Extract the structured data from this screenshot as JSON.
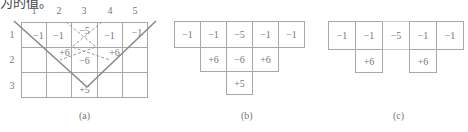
{
  "header_fragment": "为的值。",
  "panel_a": {
    "caption": "(a)",
    "col_labels": [
      "1",
      "2",
      "3",
      "4",
      "5"
    ],
    "row_labels": [
      "1",
      "2",
      "3"
    ],
    "cells": {
      "r1": [
        "−1",
        "−1",
        "−5",
        "−1",
        "−1"
      ],
      "r2": [
        "",
        "+6",
        "−6",
        "+6",
        ""
      ],
      "r3": [
        "",
        "",
        "+5",
        "",
        ""
      ]
    }
  },
  "panel_b": {
    "caption": "(b)",
    "row1": [
      "−1",
      "−1",
      "−5",
      "−1",
      "−1"
    ],
    "row2": [
      "+6",
      "−6",
      "+6"
    ],
    "row3": [
      "+5"
    ]
  },
  "panel_c": {
    "caption": "(c)",
    "row1": [
      "−1",
      "−1",
      "−5",
      "−1",
      "−1"
    ],
    "row2": [
      "+6",
      "+6"
    ]
  }
}
